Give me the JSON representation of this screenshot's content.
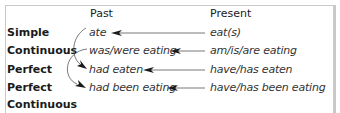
{
  "diagram": {
    "columns": [
      {
        "id": "past",
        "label": "Past"
      },
      {
        "id": "present",
        "label": "Present"
      }
    ],
    "rows": [
      {
        "label_lines": [
          "Simple"
        ],
        "past": "ate",
        "present": "eat(s)"
      },
      {
        "label_lines": [
          "Continuous"
        ],
        "past": "was/were eating",
        "present": "am/is/are eating"
      },
      {
        "label_lines": [
          "Perfect"
        ],
        "past": "had eaten",
        "present": "have/has eaten"
      },
      {
        "label_lines": [
          "Perfect",
          "Continuous"
        ],
        "past": "had been eating",
        "present": "have/has been eating"
      }
    ],
    "straight_arrows": [
      {
        "from": "eat(s)",
        "to": "ate"
      },
      {
        "from": "am/is/are eating",
        "to": "was/were eating"
      },
      {
        "from": "have/has eaten",
        "to": "had eaten"
      },
      {
        "from": "have/has been eating",
        "to": "had been eating"
      }
    ],
    "curved_arrows": [
      {
        "from": "ate",
        "to": "had eaten"
      },
      {
        "from": "was/were eating",
        "to": "had been eating"
      }
    ],
    "colors": {
      "frame": "#c9c9c9",
      "arrow": "#1a1a1a",
      "line": "#555555",
      "label_text": "#1a1a1a",
      "form_text": "#333333"
    }
  }
}
